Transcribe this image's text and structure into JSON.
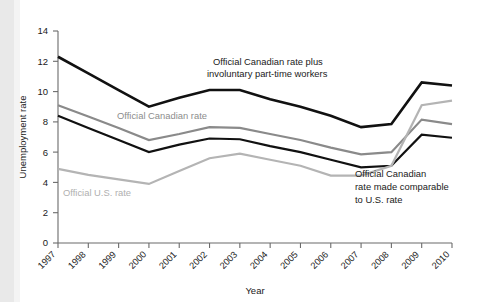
{
  "chart_data": {
    "type": "line",
    "title": "",
    "xlabel": "Year",
    "ylabel": "Unemployment rate",
    "x": [
      "1997",
      "1998",
      "1999",
      "2000",
      "2001",
      "2002",
      "2003",
      "2004",
      "2005",
      "2006",
      "2007",
      "2008",
      "2009",
      "2010"
    ],
    "categories": [
      "1997",
      "1998",
      "1999",
      "2000",
      "2001",
      "2002",
      "2003",
      "2004",
      "2005",
      "2006",
      "2007",
      "2008",
      "2009",
      "2010"
    ],
    "xlim": [
      1997,
      2010
    ],
    "ylim": [
      0,
      14
    ],
    "yticks": [
      0,
      2,
      4,
      6,
      8,
      10,
      12,
      14
    ],
    "ytick_labels": [
      "0",
      "2",
      "4",
      "6",
      "8",
      "10",
      "12",
      "14"
    ],
    "grid": false,
    "legend": "annotations-inline",
    "series": [
      {
        "name": "Official Canadian rate plus involuntary part-time workers",
        "color": "#111111",
        "width": 2.6,
        "values": [
          12.3,
          11.2,
          10.1,
          9.0,
          9.6,
          10.1,
          10.1,
          9.5,
          9.0,
          8.4,
          7.65,
          7.85,
          10.6,
          10.4
        ]
      },
      {
        "name": "Official Canadian rate",
        "color": "#8a8a8a",
        "width": 2.2,
        "values": [
          9.1,
          8.35,
          7.6,
          6.8,
          7.2,
          7.65,
          7.6,
          7.2,
          6.8,
          6.3,
          5.85,
          6.0,
          8.15,
          7.85
        ]
      },
      {
        "name": "Official Canadian rate made comparable to U.S. rate",
        "color": "#111111",
        "width": 2.2,
        "values": [
          8.4,
          7.6,
          6.8,
          6.0,
          6.5,
          6.9,
          6.85,
          6.4,
          6.0,
          5.5,
          5.0,
          5.1,
          7.15,
          6.95
        ]
      },
      {
        "name": "Official U.S. rate",
        "color": "#b4b4b4",
        "width": 2.2,
        "values": [
          4.9,
          4.5,
          4.2,
          3.9,
          4.75,
          5.6,
          5.9,
          5.5,
          5.1,
          4.45,
          4.45,
          5.1,
          9.1,
          9.4
        ]
      }
    ],
    "annotations": [
      {
        "id": "annot-top-black",
        "color": "#1a1a1a",
        "lines": [
          "Official Canadian rate plus",
          "involuntary part-time workers"
        ]
      },
      {
        "id": "annot-canadian-gray",
        "color": "#8d8d8d",
        "lines": [
          "Official Canadian rate"
        ]
      },
      {
        "id": "annot-us-lightgray",
        "color": "#b0b0b0",
        "lines": [
          "Official U.S. rate"
        ]
      },
      {
        "id": "annot-comparable-black",
        "color": "#1a1a1a",
        "lines": [
          "Official Canadian",
          "rate made comparable",
          "to U.S. rate"
        ]
      }
    ]
  },
  "axes": {
    "y_title": "Unemployment rate",
    "x_title": "Year",
    "y_tick_0": "0",
    "y_tick_1": "2",
    "y_tick_2": "4",
    "y_tick_3": "6",
    "y_tick_4": "8",
    "y_tick_5": "10",
    "y_tick_6": "12",
    "y_tick_7": "14"
  },
  "annotation_text": {
    "top_line1": "Official Canadian rate plus",
    "top_line2": "involuntary part-time workers",
    "canadian": "Official Canadian rate",
    "us": "Official U.S. rate",
    "comparable_line1": "Official Canadian",
    "comparable_line2": "rate made comparable",
    "comparable_line3": "to U.S. rate"
  }
}
